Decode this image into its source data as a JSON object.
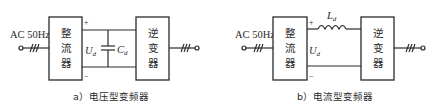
{
  "diagrams": [
    {
      "id": "a",
      "input_label": "AC 50Hz",
      "rectifier_label": [
        "整",
        "流",
        "器"
      ],
      "inverter_label": [
        "逆",
        "变",
        "器"
      ],
      "plus": "+",
      "minus": "−",
      "voltage_label_main": "U",
      "voltage_label_sub": "d",
      "element_label_main": "C",
      "element_label_sub": "d",
      "caption": "a）电压型变频器"
    },
    {
      "id": "b",
      "input_label": "AC 50Hz",
      "rectifier_label": [
        "整",
        "流",
        "器"
      ],
      "inverter_label": [
        "逆",
        "变",
        "器"
      ],
      "plus": "+",
      "minus": "−",
      "voltage_label_main": "U",
      "voltage_label_sub": "d",
      "element_label_main": "L",
      "element_label_sub": "d",
      "caption": "b）电流型变频器"
    }
  ],
  "colors": {
    "stroke": "#2a2a2a",
    "background": "#ffffff"
  }
}
